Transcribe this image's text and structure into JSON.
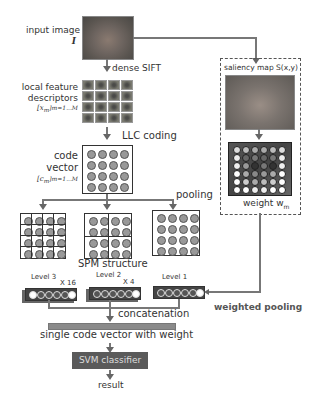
{
  "labels": {
    "input_image": "input image",
    "input_symbol": "I",
    "dense_sift": "dense SIFT",
    "local_feature": "local feature",
    "descriptors": "descriptors",
    "x_m": "[x",
    "x_m_sub": "m",
    "x_m_range": "]m=1...M",
    "llc_coding": "LLC coding",
    "code": "code",
    "vector": "vector",
    "c_m": "[c",
    "c_m_sub": "m",
    "c_m_range": "]m=1...M",
    "pooling": "pooling",
    "spm_structure": "SPM structure",
    "level3": "Level 3",
    "level2": "Level 2",
    "level1": "Level 1",
    "x16": "X 16",
    "x4": "X 4",
    "concatenation": "concatenation",
    "single_code_vector": "single code vector with weight",
    "svm_classifier": "SVM classifier",
    "result": "result",
    "saliency_map": "saliency map S(x,y)",
    "weight": "weight w",
    "weight_sub": "m",
    "weighted_pooling": "weighted pooling"
  },
  "colors": {
    "svm_box": "#5a5a5a",
    "arrow": "#666666",
    "concat_bar": "#8a8a8a"
  }
}
